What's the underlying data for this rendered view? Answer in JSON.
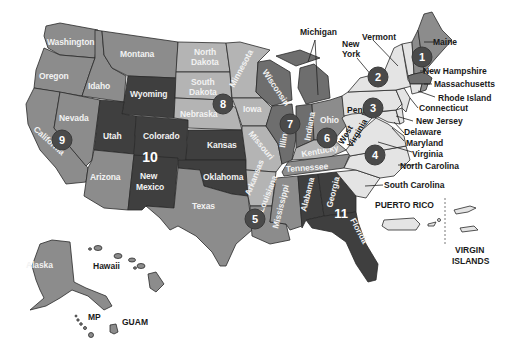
{
  "colors": {
    "tier_dark": "#3f3f3f",
    "tier_mid_dark": "#6e6e6e",
    "tier_mid": "#8c8c8c",
    "tier_light": "#b4b4b4",
    "tier_lightest": "#e4e4e4",
    "circle": "#4a4a4a",
    "background": "#ffffff"
  },
  "states": {
    "washington": "Washington",
    "oregon": "Oregon",
    "california": "California",
    "idaho": "Idaho",
    "nevada": "Nevada",
    "montana": "Montana",
    "wyoming": "Wyoming",
    "utah": "Utah",
    "colorado": "Colorado",
    "arizona": "Arizona",
    "new_mexico": "New Mexico",
    "north_dakota": "North Dakota",
    "south_dakota": "South Dakota",
    "nebraska": "Nebraska",
    "kansas": "Kansas",
    "oklahoma": "Oklahoma",
    "texas": "Texas",
    "minnesota": "Minnesota",
    "iowa": "Iowa",
    "missouri": "Missouri",
    "arkansas": "Arkansas",
    "louisiana": "Louisiana",
    "wisconsin": "Wisconsin",
    "illinois": "Illinois",
    "michigan": "Michigan",
    "indiana": "Indiana",
    "ohio": "Ohio",
    "kentucky": "Kentucky",
    "tennessee": "Tennessee",
    "mississippi": "Mississippi",
    "alabama": "Alabama",
    "georgia": "Georgia",
    "florida": "Florida",
    "south_carolina": "South Carolina",
    "north_carolina": "North Carolina",
    "virginia": "Virginia",
    "west_virginia": "West Virginia",
    "maryland": "Maryland",
    "delaware": "Delaware",
    "new_jersey": "New Jersey",
    "pennsylvania": "Pennsylvania",
    "new_york": "New York",
    "connecticut": "Connecticut",
    "rhode_island": "Rhode Island",
    "massachusetts": "Massachusetts",
    "vermont": "Vermont",
    "new_hampshire": "New Hampshire",
    "maine": "Maine",
    "alaska": "Alaska",
    "hawaii": "Hawaii"
  },
  "territories": {
    "puerto_rico": "PUERTO RICO",
    "virgin_islands_1": "VIRGIN",
    "virgin_islands_2": "ISLANDS",
    "mp": "MP",
    "guam": "GUAM"
  },
  "regions": [
    {
      "number": "1",
      "location": "Maine"
    },
    {
      "number": "2",
      "location": "New York"
    },
    {
      "number": "3",
      "location": "Pennsylvania"
    },
    {
      "number": "4",
      "location": "Virginia"
    },
    {
      "number": "5",
      "location": "Louisiana"
    },
    {
      "number": "6",
      "location": "Ohio/Indiana/Kentucky"
    },
    {
      "number": "7",
      "location": "Illinois"
    },
    {
      "number": "8",
      "location": "Nebraska/South Dakota"
    },
    {
      "number": "9",
      "location": "Nevada/California"
    },
    {
      "number": "10",
      "location": "Colorado/New Mexico"
    },
    {
      "number": "11",
      "location": "Georgia/Florida"
    }
  ]
}
